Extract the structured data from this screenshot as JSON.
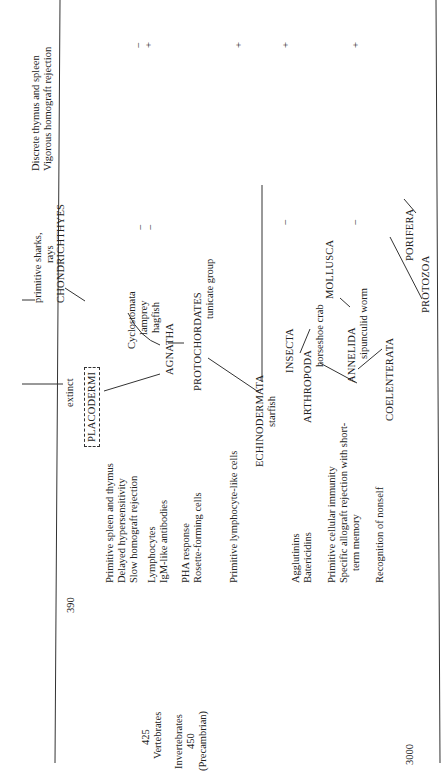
{
  "timeline": [
    {
      "value": "390",
      "label": ""
    },
    {
      "value": "425",
      "label": "Vertebrates"
    },
    {
      "value": "450",
      "label": "Invertebrates",
      "sublabel": "(Precambrian)"
    },
    {
      "value": "3000",
      "label": ""
    }
  ],
  "timeline_labels": {
    "vertebrates": "Vertebrates",
    "invertebrates": "Invertebrates",
    "precambrian": "(Precambrian)"
  },
  "immune_features": {
    "f1_line1": "Discrete thymus and spleen",
    "f1_line2": "Vigorous homograft rejection",
    "f2_line1": "Primitive spleen and thymus",
    "f2_line2": "Delayed hypersensitivity",
    "f2_line3": "Slow homograft rejection",
    "f3_line1": "Lymphocytes",
    "f3_line2": "IgM-like antibodies",
    "f4_line1": "PHA response",
    "f4_line2": "Rosette-forming cells",
    "f5_line1": "Primitive lymphocyte-like cells",
    "f6_line1": "Agglutinins",
    "f6_line2": "Batericidins",
    "f7_line1": "Primitive cellular immunity",
    "f7_line2": "Specific allograft rejection with short-",
    "f7_line3": "term memory",
    "f8_line1": "Recognition of nonself"
  },
  "taxa": {
    "extinct": "extinct",
    "placodermi": "PLACODERMI",
    "primitive_sharks": "primitive sharks,",
    "rays": "rays",
    "chondrichthyes": "CHONDRICHTHYES",
    "cyclostomata": "Cyclostomata",
    "lamprey": "lamprey",
    "hagfish": "hagfish",
    "agnatha": "AGNATHA",
    "protochordates": "PROTOCHORDATES",
    "tunicate": "tunicate group",
    "echinodermata": "ECHINODERMATA",
    "starfish": "starfish",
    "insecta": "INSECTA",
    "arthropoda": "ARTHROPODA",
    "horseshoe_crab": "horseshoe crab",
    "mollusca": "MOLLUSCA",
    "annelida": "ANNELIDA",
    "sipunculid": "sipunculid worm",
    "coelenterata": "COELENTERATA",
    "porifera": "PORIFERA",
    "protozoa": "PROTOZOA"
  },
  "marks": {
    "m1": "−",
    "m2": "+",
    "m3": "−",
    "m4": "−",
    "m5": "+",
    "m6": "+",
    "m7": "−",
    "m8": "+",
    "m9": "−"
  }
}
